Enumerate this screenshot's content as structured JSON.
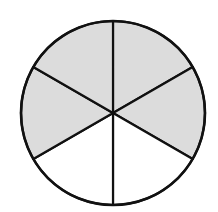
{
  "diagram": {
    "type": "fraction-circle",
    "total_parts": 6,
    "shaded_parts": 4,
    "fraction_shaded": "4/6",
    "colors": {
      "shaded": "#dcdcdc",
      "unshaded": "#ffffff",
      "stroke": "#111111"
    },
    "sectors": [
      {
        "index": 0,
        "position": "top-right",
        "shaded": true
      },
      {
        "index": 1,
        "position": "right",
        "shaded": true
      },
      {
        "index": 2,
        "position": "bottom-right",
        "shaded": false
      },
      {
        "index": 3,
        "position": "bottom-left",
        "shaded": false
      },
      {
        "index": 4,
        "position": "left",
        "shaded": true
      },
      {
        "index": 5,
        "position": "top-left",
        "shaded": true
      }
    ]
  }
}
